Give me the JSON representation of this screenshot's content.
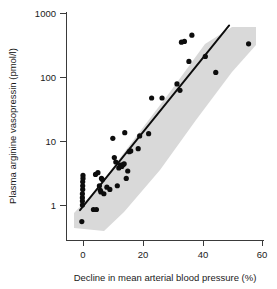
{
  "chart_data": {
    "type": "scatter",
    "title": "",
    "xlabel": "Decline in mean arterial blood pressure (%)",
    "ylabel": "Plasma arginine vasopressin (pmol/l)",
    "xlim": [
      -3,
      60
    ],
    "ylim": [
      0.4,
      1000
    ],
    "yscale": "log",
    "xscale": "linear",
    "grid": false,
    "legend": null,
    "xticks": [
      0,
      20,
      40,
      60
    ],
    "xtick_labels": [
      "0",
      "20",
      "40",
      "60"
    ],
    "yticks": [
      1,
      10,
      100,
      1000
    ],
    "ytick_labels": [
      "1",
      "10",
      "100",
      "1000"
    ],
    "points": [
      [
        -0.4,
        0.55
      ],
      [
        -0.2,
        1.0
      ],
      [
        -0.2,
        1.15
      ],
      [
        -0.2,
        1.3
      ],
      [
        -0.2,
        1.5
      ],
      [
        -0.1,
        1.75
      ],
      [
        -0.1,
        2.0
      ],
      [
        -0.1,
        2.3
      ],
      [
        0.0,
        2.6
      ],
      [
        0.0,
        2.9
      ],
      [
        3.5,
        0.85
      ],
      [
        4.5,
        0.85
      ],
      [
        4.2,
        3.0
      ],
      [
        5.0,
        3.2
      ],
      [
        5.5,
        2.0
      ],
      [
        5.8,
        1.7
      ],
      [
        6.0,
        1.6
      ],
      [
        6.2,
        2.6
      ],
      [
        6.5,
        2.5
      ],
      [
        7.0,
        1.5
      ],
      [
        8.0,
        1.9
      ],
      [
        9.0,
        1.75
      ],
      [
        10.0,
        11.0
      ],
      [
        10.5,
        5.5
      ],
      [
        11.0,
        4.7
      ],
      [
        11.5,
        2.0
      ],
      [
        12.0,
        3.8
      ],
      [
        12.5,
        4.2
      ],
      [
        13.0,
        4.0
      ],
      [
        13.5,
        4.3
      ],
      [
        13.8,
        4.4
      ],
      [
        14.0,
        13.5
      ],
      [
        14.5,
        2.6
      ],
      [
        15.0,
        3.4
      ],
      [
        15.5,
        6.8
      ],
      [
        16.0,
        7.0
      ],
      [
        18.5,
        7.6
      ],
      [
        19.0,
        12.0
      ],
      [
        22.0,
        13.0
      ],
      [
        23.0,
        47.0
      ],
      [
        26.5,
        47.0
      ],
      [
        31.5,
        78.0
      ],
      [
        32.5,
        62.0
      ],
      [
        33.0,
        350.0
      ],
      [
        34.0,
        360.0
      ],
      [
        35.5,
        175.0
      ],
      [
        36.5,
        450.0
      ],
      [
        41.0,
        210.0
      ],
      [
        44.5,
        118.0
      ],
      [
        55.5,
        330.0
      ]
    ],
    "regression_line": {
      "x_start": -1.0,
      "y_start": 0.83,
      "x_end": 49.0,
      "y_end": 640.0
    },
    "confidence_band": {
      "description": "shaded 95% prediction band around regression line",
      "color": "#d9d9d9"
    }
  },
  "axis": {
    "y_title": "Plasma arginine vasopressin (pmol/l)",
    "x_title": "Decline in mean arterial blood pressure (%)",
    "y_tick_1000": "1000",
    "y_tick_100": "100",
    "y_tick_10": "10",
    "y_tick_1": "1",
    "x_tick_0": "0",
    "x_tick_20": "20",
    "x_tick_40": "40",
    "x_tick_60": "60"
  },
  "colors": {
    "point": "#0d0d0d",
    "line": "#0d0d0d",
    "band": "#d9d9d9",
    "axis": "#3a3a3a",
    "text": "#1a1a1a",
    "background": "#ffffff"
  }
}
